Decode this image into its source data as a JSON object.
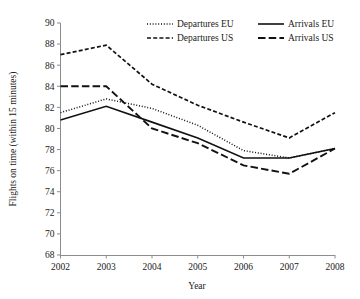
{
  "chart_data": {
    "type": "line",
    "title": "",
    "xlabel": "Year",
    "ylabel": "Flights on time (within 15 minutes)",
    "categories": [
      "2002",
      "2003",
      "2004",
      "2005",
      "2006",
      "2007",
      "2008"
    ],
    "x": [
      2002,
      2003,
      2004,
      2005,
      2006,
      2007,
      2008
    ],
    "xlim": [
      2002,
      2008
    ],
    "ylim": [
      68,
      90
    ],
    "ytick_labels": [
      "68",
      "70",
      "72",
      "74",
      "76",
      "78",
      "80",
      "82",
      "84",
      "86",
      "88",
      "90"
    ],
    "yticks": [
      68,
      70,
      72,
      74,
      76,
      78,
      80,
      82,
      84,
      86,
      88,
      90
    ],
    "grid": false,
    "legend_position": "top",
    "series": [
      {
        "name": "Departures EU",
        "style": "dotted",
        "values": [
          81.5,
          82.8,
          81.9,
          80.3,
          77.9,
          77.2,
          78.1
        ]
      },
      {
        "name": "Departures US",
        "style": "dashed",
        "values": [
          87.0,
          87.9,
          84.2,
          82.2,
          80.6,
          79.1,
          81.5
        ]
      },
      {
        "name": "Arrivals EU",
        "style": "solid",
        "values": [
          80.8,
          82.1,
          80.6,
          79.1,
          77.2,
          77.2,
          78.1
        ]
      },
      {
        "name": "Arrivals US",
        "style": "longdash",
        "values": [
          84.0,
          84.0,
          80.0,
          78.6,
          76.5,
          75.7,
          78.1
        ]
      }
    ]
  },
  "legend": {
    "entries": [
      {
        "label": "Departures EU",
        "style": "dotted"
      },
      {
        "label": "Departures US",
        "style": "dashed"
      },
      {
        "label": "Arrivals EU",
        "style": "solid"
      },
      {
        "label": "Arrivals US",
        "style": "longdash"
      }
    ]
  },
  "colors": {
    "line": "#111111",
    "axis": "#8c8c8c",
    "text": "#1a1a1a",
    "background": "#ffffff"
  }
}
